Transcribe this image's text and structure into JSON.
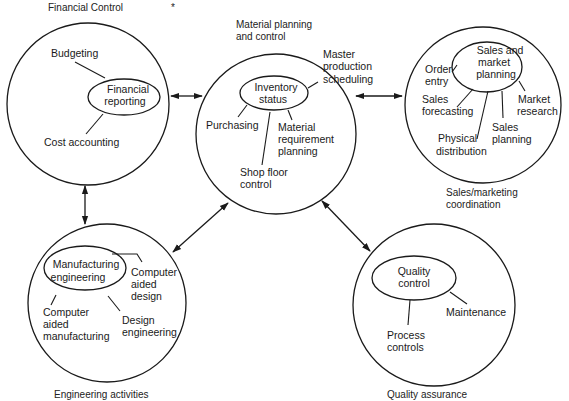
{
  "diagram": {
    "stray_mark": "*",
    "nodes": [
      {
        "id": "financial",
        "title": [
          "Financial Control"
        ],
        "hub": [
          "Financial",
          "reporting"
        ],
        "items": [
          [
            "Budgeting"
          ],
          [
            "Cost accounting"
          ]
        ]
      },
      {
        "id": "material",
        "title": [
          "Material planning",
          "and control"
        ],
        "hub": [
          "Inventory",
          "status"
        ],
        "items": [
          [
            "Master",
            "production",
            "scheduling"
          ],
          [
            "Purchasing"
          ],
          [
            "Material",
            "requirement",
            "planning"
          ],
          [
            "Shop floor",
            "control"
          ]
        ]
      },
      {
        "id": "sales",
        "title": [
          "Sales/marketing",
          "coordination"
        ],
        "hub": [
          "Sales and",
          "market",
          "planning"
        ],
        "items": [
          [
            "Order",
            "entry"
          ],
          [
            "Sales",
            "forecasting"
          ],
          [
            "Physical",
            "distribution"
          ],
          [
            "Sales",
            "planning"
          ],
          [
            "Market",
            "research"
          ]
        ]
      },
      {
        "id": "engineering",
        "title": [
          "Engineering activities"
        ],
        "hub": [
          "Manufacturing",
          "engineering"
        ],
        "items": [
          [
            "Computer",
            "aided",
            "design"
          ],
          [
            "Computer",
            "aided",
            "manufacturing"
          ],
          [
            "Design",
            "engineering"
          ]
        ]
      },
      {
        "id": "quality",
        "title": [
          "Quality assurance"
        ],
        "hub": [
          "Quality",
          "control"
        ],
        "items": [
          [
            "Maintenance"
          ],
          [
            "Process",
            "controls"
          ]
        ]
      }
    ],
    "connections": [
      {
        "from": "financial",
        "to": "material",
        "type": "bidirectional"
      },
      {
        "from": "material",
        "to": "sales",
        "type": "bidirectional"
      },
      {
        "from": "financial",
        "to": "engineering",
        "type": "bidirectional"
      },
      {
        "from": "material",
        "to": "engineering",
        "type": "bidirectional"
      },
      {
        "from": "material",
        "to": "quality",
        "type": "bidirectional"
      }
    ]
  }
}
